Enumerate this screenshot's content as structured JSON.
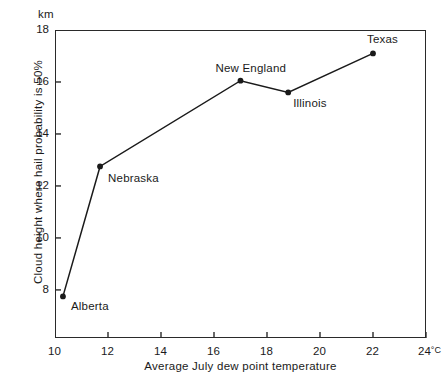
{
  "chart_data": {
    "type": "line",
    "title": "",
    "subtitle": "",
    "xlabel": "Average July dew point temperature",
    "ylabel": "Cloud height where hail probability is 50%",
    "x_unit": "°C",
    "y_unit": "km",
    "xlim": [
      10,
      24
    ],
    "ylim": [
      6.15,
      18
    ],
    "grid": false,
    "legend": "none",
    "x_ticks": [
      "10",
      "12",
      "14",
      "16",
      "18",
      "20",
      "22",
      "24"
    ],
    "x_tick_values": [
      10,
      12,
      14,
      16,
      18,
      20,
      22,
      24
    ],
    "x_last_tick_suffix": "°C",
    "y_ticks": [
      "8",
      "10",
      "12",
      "14",
      "16",
      "18"
    ],
    "y_tick_values": [
      8,
      10,
      12,
      14,
      16,
      18
    ],
    "points": [
      {
        "label": "Alberta",
        "x": 10.3,
        "y": 7.75,
        "label_dx": 8,
        "label_dy": 4
      },
      {
        "label": "Nebraska",
        "x": 11.7,
        "y": 12.75,
        "label_dx": 8,
        "label_dy": 6
      },
      {
        "label": "New England",
        "x": 17.0,
        "y": 16.05,
        "label_dx": -25,
        "label_dy": -19
      },
      {
        "label": "Illinois",
        "x": 18.8,
        "y": 15.6,
        "label_dx": 5,
        "label_dy": 5
      },
      {
        "label": "Texas",
        "x": 22.0,
        "y": 17.1,
        "label_dx": -6,
        "label_dy": -20
      }
    ],
    "series": [
      {
        "name": "Cloud height vs dew point",
        "x": [
          10.3,
          11.7,
          17.0,
          18.8,
          22.0
        ],
        "values": [
          7.75,
          12.75,
          16.05,
          15.6,
          17.1
        ]
      }
    ],
    "annotations": [
      "Alberta",
      "Nebraska",
      "New England",
      "Illinois",
      "Texas"
    ]
  },
  "style": {
    "line_color": "#1a1a1a",
    "marker_color": "#1a1a1a",
    "frame_color": "#2a2a2a",
    "text_color": "#1a1a1a",
    "background": "#ffffff"
  }
}
